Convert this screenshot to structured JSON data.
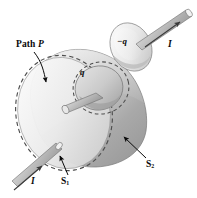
{
  "figure": {
    "background_color": "#ffffff",
    "ink_color": "#0a0a0a",
    "surface_colors": {
      "light": "#f2f2f2",
      "mid": "#cfcfcf",
      "dark": "#a8a8a8",
      "darkest": "#8c8c8c",
      "outline": "#6b6b6b",
      "dashed": "#555555"
    }
  },
  "labels": {
    "path": "Path P",
    "path_name": "Path",
    "path_symbol": "P",
    "charge_negative": "−q",
    "charge_positive": "q",
    "current_top": "I",
    "current_bottom": "I",
    "surface_flat": "S",
    "surface_flat_sub": "1",
    "surface_bulge": "S",
    "surface_bulge_sub": "2"
  },
  "annotations": [
    {
      "name": "path-p-callout",
      "text": "Path P",
      "points_to": "dashed-rim-of-flat-disk"
    },
    {
      "name": "s1-callout",
      "text": "S1",
      "points_to": "flat-disk-surface"
    },
    {
      "name": "s2-callout",
      "text": "S2",
      "points_to": "bulging-cone-surface"
    },
    {
      "name": "neg-charge-label",
      "text": "−q",
      "points_to": "upper-capacitor-plate"
    },
    {
      "name": "pos-charge-label",
      "text": "q",
      "points_to": "inner-capacitor-plate"
    },
    {
      "name": "current-top-label",
      "text": "I",
      "points_to": "upper-wire"
    },
    {
      "name": "current-bottom-label",
      "text": "I",
      "points_to": "lower-wire"
    }
  ],
  "parts": [
    {
      "name": "flat-disk-s1",
      "description": "flat elliptical disk surface bounded by path P"
    },
    {
      "name": "cone-surface-s2",
      "description": "bulging cone-shaped surface sharing the same boundary path P"
    },
    {
      "name": "inner-plate",
      "description": "capacitor plate carrying charge q inside the cone"
    },
    {
      "name": "upper-plate",
      "description": "separated capacitor plate carrying charge minus q"
    },
    {
      "name": "lower-wire",
      "description": "wire entering from lower left carrying current I"
    },
    {
      "name": "upper-wire",
      "description": "wire leaving upper right carrying current I"
    }
  ]
}
